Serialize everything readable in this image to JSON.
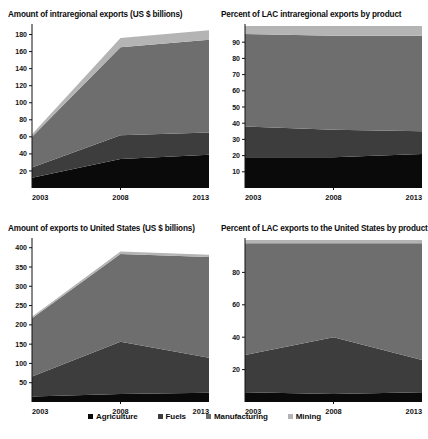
{
  "figure": {
    "background": "#ffffff",
    "series_colors": {
      "Agriculture": "#0a0a0a",
      "Fuels": "#3d3d3d",
      "Manufacturing": "#6e6e6e",
      "Mining": "#b4b4b4"
    }
  },
  "legend": {
    "position": "bottom",
    "items": [
      {
        "label": "Agriculture",
        "color": "#0a0a0a"
      },
      {
        "label": "Fuels",
        "color": "#3d3d3d"
      },
      {
        "label": "Manufacturing",
        "color": "#6e6e6e"
      },
      {
        "label": "Mining",
        "color": "#b4b4b4"
      }
    ]
  },
  "chart_data": [
    {
      "id": "intraregional-amount",
      "type": "area",
      "stacked": true,
      "title": "Amount of intraregional exports (US $ billions)",
      "xlabel": "",
      "ylabel": "",
      "x": [
        2003,
        2008,
        2013
      ],
      "xticklabels": [
        "2003",
        "2008",
        "2013"
      ],
      "yticks": [
        20,
        40,
        60,
        80,
        100,
        120,
        140,
        160,
        180
      ],
      "yticklabels": [
        "20",
        "40",
        "60",
        "80",
        "100",
        "120",
        "140",
        "160",
        "180"
      ],
      "ylim": [
        0,
        190
      ],
      "xlim": [
        2003,
        2013
      ],
      "grid": false,
      "series": [
        {
          "name": "Agriculture",
          "color": "#0a0a0a",
          "values": [
            12,
            34,
            39
          ]
        },
        {
          "name": "Fuels",
          "color": "#3d3d3d",
          "values": [
            12,
            28,
            26
          ]
        },
        {
          "name": "Manufacturing",
          "color": "#6e6e6e",
          "values": [
            36,
            103,
            109
          ]
        },
        {
          "name": "Mining",
          "color": "#b4b4b4",
          "values": [
            3,
            11,
            11
          ]
        }
      ],
      "totals": [
        63,
        176,
        185
      ]
    },
    {
      "id": "intraregional-percent",
      "type": "area",
      "stacked": true,
      "title": "Percent of LAC intraregional exports by product",
      "xlabel": "",
      "ylabel": "",
      "x": [
        2003,
        2008,
        2013
      ],
      "xticklabels": [
        "2003",
        "2008",
        "2013"
      ],
      "yticks": [
        10,
        20,
        30,
        40,
        50,
        60,
        70,
        80,
        90
      ],
      "yticklabels": [
        "10",
        "20",
        "30",
        "40",
        "50",
        "60",
        "70",
        "80",
        "90"
      ],
      "ylim": [
        0,
        100
      ],
      "xlim": [
        2003,
        2013
      ],
      "grid": false,
      "series": [
        {
          "name": "Agriculture",
          "color": "#0a0a0a",
          "values": [
            19,
            19,
            21
          ]
        },
        {
          "name": "Fuels",
          "color": "#3d3d3d",
          "values": [
            19,
            17,
            14
          ]
        },
        {
          "name": "Manufacturing",
          "color": "#6e6e6e",
          "values": [
            57,
            58,
            59
          ]
        },
        {
          "name": "Mining",
          "color": "#b4b4b4",
          "values": [
            5,
            6,
            6
          ]
        }
      ],
      "totals": [
        100,
        100,
        100
      ]
    },
    {
      "id": "united-states-amount",
      "type": "area",
      "stacked": true,
      "title": "Amount of exports to United States (US $ billions)",
      "xlabel": "",
      "ylabel": "",
      "x": [
        2003,
        2008,
        2013
      ],
      "xticklabels": [
        "2003",
        "2008",
        "2013"
      ],
      "yticks": [
        50,
        100,
        150,
        200,
        250,
        300,
        350,
        400
      ],
      "yticklabels": [
        "50",
        "100",
        "150",
        "200",
        "250",
        "300",
        "350",
        "400"
      ],
      "ylim": [
        0,
        420
      ],
      "xlim": [
        2003,
        2013
      ],
      "grid": false,
      "series": [
        {
          "name": "Agriculture",
          "color": "#0a0a0a",
          "values": [
            14,
            21,
            24
          ]
        },
        {
          "name": "Fuels",
          "color": "#3d3d3d",
          "values": [
            52,
            135,
            91
          ]
        },
        {
          "name": "Manufacturing",
          "color": "#6e6e6e",
          "values": [
            151,
            228,
            261
          ]
        },
        {
          "name": "Mining",
          "color": "#b4b4b4",
          "values": [
            4,
            6,
            6
          ]
        }
      ],
      "totals": [
        221,
        390,
        382
      ]
    },
    {
      "id": "united-states-percent",
      "type": "area",
      "stacked": true,
      "title": "Percent of LAC exports to the United States by product",
      "xlabel": "",
      "ylabel": "",
      "x": [
        2003,
        2008,
        2013
      ],
      "xticklabels": [
        "2003",
        "2008",
        "2013"
      ],
      "yticks": [
        20,
        40,
        60,
        80
      ],
      "yticklabels": [
        "20",
        "40",
        "60",
        "80"
      ],
      "ylim": [
        0,
        100
      ],
      "xlim": [
        2003,
        2013
      ],
      "grid": false,
      "series": [
        {
          "name": "Agriculture",
          "color": "#0a0a0a",
          "values": [
            6,
            5,
            6
          ]
        },
        {
          "name": "Fuels",
          "color": "#3d3d3d",
          "values": [
            23,
            35,
            20
          ]
        },
        {
          "name": "Manufacturing",
          "color": "#6e6e6e",
          "values": [
            69,
            58,
            72
          ]
        },
        {
          "name": "Mining",
          "color": "#b4b4b4",
          "values": [
            2,
            2,
            2
          ]
        }
      ],
      "totals": [
        100,
        100,
        100
      ]
    }
  ]
}
